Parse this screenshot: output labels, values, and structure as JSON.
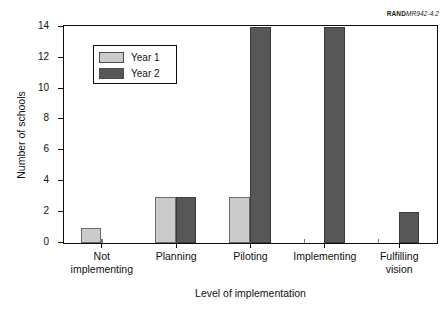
{
  "source_id": {
    "bold": "RAND",
    "italic": "MR942-4.2"
  },
  "legend": {
    "position": "inside-top-left",
    "entries": [
      {
        "label": "Year 1",
        "color": "#cbcbcb"
      },
      {
        "label": "Year 2",
        "color": "#575757"
      }
    ]
  },
  "chart_data": {
    "type": "bar",
    "title": "",
    "subtitle": "",
    "xlabel": "Level of implementation",
    "ylabel": "Number of schools",
    "categories": [
      "Not implementing",
      "Planning",
      "Piloting",
      "Implementing",
      "Fulfilling vision"
    ],
    "series": [
      {
        "name": "Year 1",
        "color": "#cbcbcb",
        "values": [
          1,
          3,
          3,
          0,
          0
        ]
      },
      {
        "name": "Year 2",
        "color": "#575757",
        "values": [
          0,
          3,
          14,
          14,
          2
        ]
      }
    ],
    "ylim": [
      0,
      14
    ],
    "yticks": [
      0,
      2,
      4,
      6,
      8,
      10,
      12,
      14
    ],
    "ytick_labels": [
      "0",
      "2",
      "4",
      "6",
      "8",
      "10",
      "12",
      "14"
    ],
    "grid": false,
    "legend_position": "upper left",
    "annotations": [
      "RANDMR942-4.2"
    ]
  }
}
